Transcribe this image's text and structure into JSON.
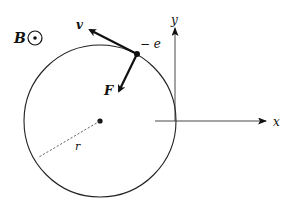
{
  "diagram": {
    "field": {
      "label": "B",
      "symbol": "out-of-page (dot in circle)"
    },
    "charge": {
      "label": "− e"
    },
    "velocity": {
      "label": "v"
    },
    "force": {
      "label": "F"
    },
    "radius": {
      "label": "r"
    },
    "axes": {
      "x_label": "x",
      "y_label": "y"
    }
  },
  "colors": {
    "line": "#111111",
    "dashed": "#555555",
    "background": "#ffffff"
  }
}
